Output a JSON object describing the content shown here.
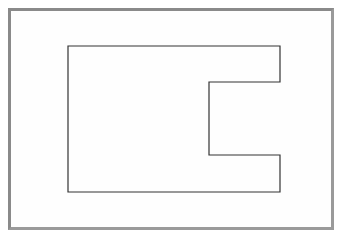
{
  "diagram": {
    "type": "outline-shape",
    "stroke_color": "#333333",
    "frame_color": "#8a8a8a",
    "points": "68,46 280,46 280,82 209,82 209,155 280,155 280,192 68,192"
  }
}
